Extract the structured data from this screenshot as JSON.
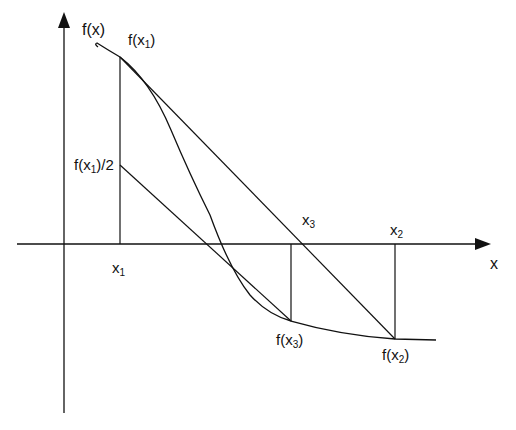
{
  "diagram": {
    "type": "secant-method / regula falsi illustration",
    "axes": {
      "y_label": "f(x)",
      "x_label": "x"
    },
    "labels": {
      "f_x1": {
        "base": "f(x",
        "sub": "1",
        "close": ")"
      },
      "f_x1_half": {
        "base": "f(x",
        "sub": "1",
        "close": ")/2"
      },
      "x1": {
        "base": "x",
        "sub": "1"
      },
      "x2": {
        "base": "x",
        "sub": "2"
      },
      "x3": {
        "base": "x",
        "sub": "3"
      },
      "f_x2": {
        "base": "f(x",
        "sub": "2",
        "close": ")"
      },
      "f_x3": {
        "base": "f(x",
        "sub": "3",
        "close": ")"
      }
    },
    "colors": {
      "stroke": "#111111",
      "background": "#ffffff"
    }
  }
}
